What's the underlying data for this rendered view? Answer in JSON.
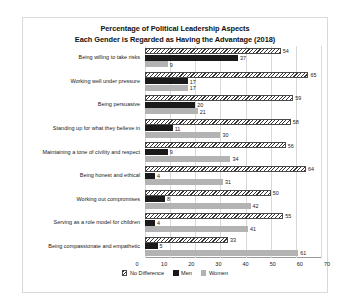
{
  "chart_data": {
    "type": "bar",
    "orientation": "horizontal",
    "title": "Percentage of Political Leadership Aspects Each Gender is Regarded as Having the Advantage (2018)",
    "title_lines": [
      "Percentage of Political Leadership Aspects",
      "Each Gender is Regarded as Having the Advantage (2018)"
    ],
    "xlabel": "",
    "ylabel": "",
    "xlim": [
      0,
      70
    ],
    "xticks": [
      0,
      10,
      20,
      30,
      40,
      50,
      60,
      70
    ],
    "grid": true,
    "legend_position": "bottom",
    "categories": [
      "Being willing to take risks",
      "Working well under pressure",
      "Being persuasive",
      "Standing up for what they believe in",
      "Maintaining a tone of civility and respect",
      "Being honest and ethical",
      "Working out compromises",
      "Serving as a role model for children",
      "Being compassionate and empathetic"
    ],
    "series": [
      {
        "name": "No Difference",
        "color": "#ffffff",
        "pattern": "diagonal-hatch",
        "values": [
          54,
          65,
          59,
          58,
          56,
          64,
          50,
          55,
          33
        ]
      },
      {
        "name": "Men",
        "color": "#1a1a1a",
        "pattern": "solid",
        "values": [
          37,
          17,
          20,
          11,
          9,
          4,
          8,
          4,
          5
        ]
      },
      {
        "name": "Women",
        "color": "#b3b3b3",
        "pattern": "solid",
        "values": [
          9,
          17,
          21,
          30,
          34,
          31,
          42,
          41,
          61
        ]
      }
    ]
  }
}
